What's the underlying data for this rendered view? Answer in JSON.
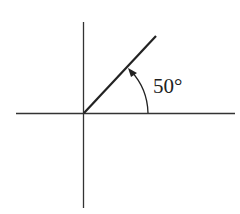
{
  "diagram": {
    "type": "angle-in-standard-position",
    "angle_label": "50°",
    "angle_degrees": 50,
    "colors": {
      "stroke": "#222222",
      "background": "#ffffff"
    },
    "elements": [
      "x-axis",
      "y-axis",
      "terminal-ray",
      "angle-arc-with-arrow",
      "angle-label"
    ]
  }
}
